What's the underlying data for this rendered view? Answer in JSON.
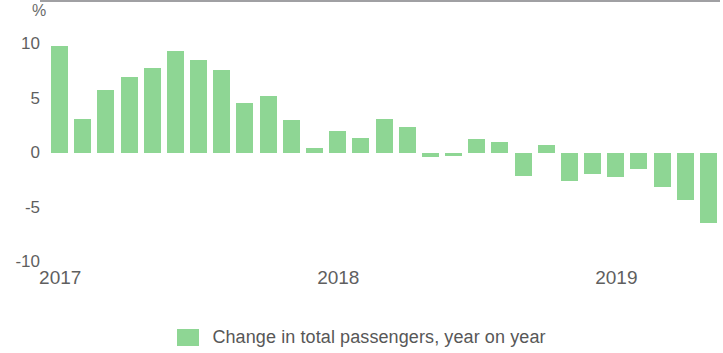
{
  "chart_data": {
    "type": "bar",
    "title": "",
    "subtitle": "",
    "xlabel": "",
    "ylabel": "%",
    "unit_label": "%",
    "ylim": [
      -10,
      10
    ],
    "yticks": [
      10,
      5,
      0,
      -5,
      -10
    ],
    "ytick_labels": [
      "10",
      "5",
      "0",
      "-5",
      "-10"
    ],
    "xtick_labels": [
      "2017",
      "2018",
      "2019"
    ],
    "grid": false,
    "legend_position": "bottom-center",
    "legend": [
      "Change in total passengers, year on year"
    ],
    "series": [
      {
        "name": "Change in total passengers, year on year",
        "color": "#8ed694",
        "values": [
          9.8,
          3.1,
          5.8,
          7.0,
          7.8,
          9.4,
          8.5,
          7.6,
          4.6,
          5.2,
          3.0,
          0.5,
          2.0,
          1.4,
          3.1,
          2.4,
          -0.4,
          -0.3,
          1.3,
          1.0,
          -2.1,
          0.7,
          -2.6,
          -1.9,
          -2.2,
          -1.5,
          -3.1,
          -4.3,
          -6.4
        ]
      }
    ],
    "categories": [
      "2017-01",
      "2017-02",
      "2017-03",
      "2017-04",
      "2017-05",
      "2017-06",
      "2017-07",
      "2017-08",
      "2017-09",
      "2017-10",
      "2017-11",
      "2017-12",
      "2018-01",
      "2018-02",
      "2018-03",
      "2018-04",
      "2018-05",
      "2018-06",
      "2018-07",
      "2018-08",
      "2018-09",
      "2018-10",
      "2018-11",
      "2018-12",
      "2019-01",
      "2019-02",
      "2019-03",
      "2019-04",
      "2019-05"
    ],
    "xtick_positions": [
      0,
      12,
      24
    ]
  },
  "axis": {
    "unit": "%",
    "y_labels": [
      "10",
      "5",
      "0",
      "-5",
      "-10"
    ],
    "x_labels": [
      "2017",
      "2018",
      "2019"
    ]
  },
  "legend": {
    "label": "Change in total passengers, year on year",
    "swatch_color": "#8ed694"
  },
  "colors": {
    "bar": "#8ed694",
    "axis_line": "#8f8f93",
    "text": "#5f5f5f"
  }
}
